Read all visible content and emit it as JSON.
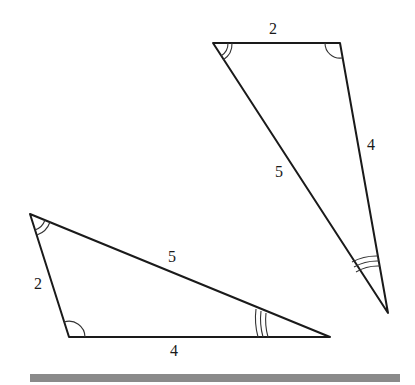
{
  "diagram": {
    "type": "congruent-triangles",
    "triangles": [
      {
        "id": "upper",
        "vertices": [
          [
            213,
            43
          ],
          [
            340,
            43
          ],
          [
            388,
            313
          ]
        ],
        "sides": [
          {
            "label": "2",
            "pos": [
              273,
              30
            ]
          },
          {
            "label": "4",
            "pos": [
              371,
              146
            ]
          },
          {
            "label": "5",
            "pos": [
              279,
              173
            ]
          }
        ],
        "angle_marks": [
          {
            "vertex": 0,
            "arcs": 2
          },
          {
            "vertex": 1,
            "arcs": 1
          },
          {
            "vertex": 2,
            "arcs": 3
          }
        ]
      },
      {
        "id": "lower",
        "vertices": [
          [
            30,
            214
          ],
          [
            69,
            337
          ],
          [
            330,
            337
          ]
        ],
        "sides": [
          {
            "label": "2",
            "pos": [
              38,
              285
            ]
          },
          {
            "label": "4",
            "pos": [
              174,
              352
            ]
          },
          {
            "label": "5",
            "pos": [
              172,
              258
            ]
          }
        ],
        "angle_marks": [
          {
            "vertex": 0,
            "arcs": 2
          },
          {
            "vertex": 1,
            "arcs": 1
          },
          {
            "vertex": 2,
            "arcs": 3
          }
        ]
      }
    ],
    "bar_color": "#8a8a8a",
    "line_color": "#1a1a1a"
  }
}
